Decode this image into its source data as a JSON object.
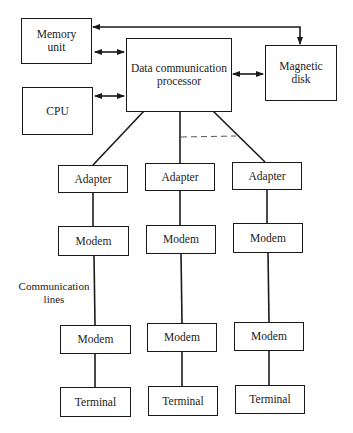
{
  "diagram": {
    "nodes": {
      "memory": {
        "label": "Memory unit",
        "line1": "Memory",
        "line2": "unit"
      },
      "cpu": {
        "label": "CPU"
      },
      "dcp": {
        "label": "Data communication processor",
        "line1": "Data communication",
        "line2": "processor"
      },
      "disk": {
        "label": "Magnetic disk",
        "line1": "Magnetic",
        "line2": "disk"
      },
      "adapters": [
        "Adapter",
        "Adapter",
        "Adapter"
      ],
      "modems_top": [
        "Modem",
        "Modem",
        "Modem"
      ],
      "modems_bottom": [
        "Modem",
        "Modem",
        "Modem"
      ],
      "terminals": [
        "Terminal",
        "Terminal",
        "Terminal"
      ]
    },
    "annotations": {
      "comm_lines_1": "Communication",
      "comm_lines_2": "lines"
    },
    "edges": [
      {
        "from": "Memory unit",
        "to": "Magnetic disk",
        "type": "arrow"
      },
      {
        "from": "Memory unit",
        "to": "Data communication processor",
        "type": "bidirectional"
      },
      {
        "from": "CPU",
        "to": "Data communication processor",
        "type": "bidirectional"
      },
      {
        "from": "Data communication processor",
        "to": "Magnetic disk",
        "type": "bidirectional"
      },
      {
        "from": "Data communication processor",
        "to": "Adapter 1",
        "type": "line"
      },
      {
        "from": "Data communication processor",
        "to": "Adapter 2",
        "type": "line"
      },
      {
        "from": "Data communication processor",
        "to": "Adapter 3",
        "type": "line"
      },
      {
        "from": "Adapter",
        "to": "Modem",
        "type": "line"
      },
      {
        "from": "Modem",
        "to": "Modem",
        "type": "communication line"
      },
      {
        "from": "Modem",
        "to": "Terminal",
        "type": "line"
      }
    ]
  }
}
